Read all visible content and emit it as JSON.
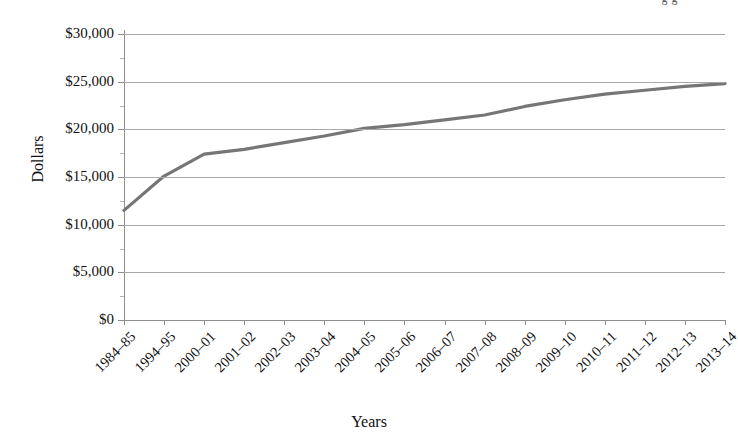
{
  "header_clip": "g g",
  "chart_data": {
    "type": "line",
    "title": "",
    "xlabel": "Years",
    "ylabel": "Dollars",
    "categories": [
      "1984–85",
      "1994–95",
      "2000–01",
      "2001–02",
      "2002–03",
      "2003–04",
      "2004–05",
      "2005–06",
      "2006–07",
      "2007–08",
      "2008–09",
      "2009–10",
      "2010–11",
      "2011–12",
      "2012–13",
      "2013–14"
    ],
    "values": [
      11500,
      15100,
      17400,
      17900,
      18600,
      19300,
      20100,
      20500,
      21000,
      21500,
      22400,
      23100,
      23700,
      24100,
      24500,
      24800
    ],
    "series": [
      {
        "name": "Dollars",
        "color": "#767676",
        "values": [
          11500,
          15100,
          17400,
          17900,
          18600,
          19300,
          20100,
          20500,
          21000,
          21500,
          22400,
          23100,
          23700,
          24100,
          24500,
          24800
        ]
      }
    ],
    "ylim": [
      0,
      30000
    ],
    "ytick_values": [
      0,
      5000,
      10000,
      15000,
      20000,
      25000,
      30000
    ],
    "ytick_labels": [
      "$0",
      "$5,000",
      "$10,000",
      "$15,000",
      "$20,000",
      "$25,000",
      "$30,000"
    ],
    "grid": true,
    "legend": "none",
    "line_color": "#767676",
    "grid_color": "#a8a8a8",
    "axis_color": "#8e8e8e"
  }
}
